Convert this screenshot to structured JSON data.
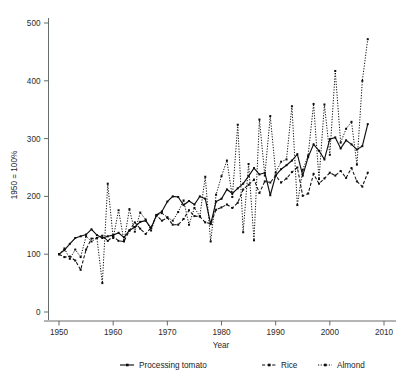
{
  "chart_data": {
    "type": "line",
    "title": "",
    "xlabel": "Year",
    "ylabel": "1950 = 100%",
    "xlim": [
      1948,
      2011
    ],
    "ylim": [
      0,
      520
    ],
    "xticks": [
      1950,
      1960,
      1970,
      1980,
      1990,
      2000,
      2010
    ],
    "xtick_labels": [
      "1950",
      "1960",
      "1970",
      "1980",
      "1990",
      "2000",
      "2010"
    ],
    "yticks": [
      0,
      100,
      200,
      300,
      400,
      500
    ],
    "ytick_labels": [
      "0",
      "100",
      "200",
      "300",
      "400",
      "500"
    ],
    "grid": false,
    "legend_position": "bottom",
    "x": [
      1950,
      1951,
      1952,
      1953,
      1954,
      1955,
      1956,
      1957,
      1958,
      1959,
      1960,
      1961,
      1962,
      1963,
      1964,
      1965,
      1966,
      1967,
      1968,
      1969,
      1970,
      1971,
      1972,
      1973,
      1974,
      1975,
      1976,
      1977,
      1978,
      1979,
      1980,
      1981,
      1982,
      1983,
      1984,
      1985,
      1986,
      1987,
      1988,
      1989,
      1990,
      1991,
      1992,
      1993,
      1994,
      1995,
      1996,
      1997,
      1998,
      1999,
      2000,
      2001,
      2002,
      2003,
      2004,
      2005,
      2006,
      2007
    ],
    "series": [
      {
        "name": "Processing tomato",
        "style": "solid",
        "marker": "square",
        "values": [
          100,
          107,
          118,
          128,
          131,
          134,
          143,
          133,
          128,
          131,
          133,
          137,
          129,
          141,
          147,
          156,
          158,
          145,
          168,
          174,
          191,
          200,
          199,
          185,
          192,
          186,
          200,
          196,
          152,
          191,
          196,
          212,
          205,
          214,
          222,
          235,
          249,
          238,
          241,
          202,
          236,
          247,
          254,
          262,
          273,
          236,
          268,
          290,
          279,
          264,
          299,
          302,
          283,
          297,
          290,
          281,
          287,
          325
        ]
      },
      {
        "name": "Rice",
        "style": "dashed",
        "marker": "square",
        "values": [
          100,
          95,
          96,
          89,
          73,
          108,
          127,
          128,
          132,
          123,
          131,
          123,
          122,
          141,
          155,
          144,
          135,
          146,
          167,
          158,
          163,
          151,
          151,
          161,
          176,
          166,
          165,
          155,
          153,
          177,
          181,
          186,
          180,
          189,
          212,
          220,
          229,
          206,
          226,
          224,
          236,
          224,
          231,
          242,
          250,
          201,
          205,
          239,
          222,
          231,
          241,
          236,
          244,
          232,
          249,
          226,
          217,
          241
        ]
      },
      {
        "name": "Almond",
        "style": "dotted",
        "marker": "square",
        "values": [
          100,
          110,
          92,
          108,
          95,
          131,
          122,
          128,
          50,
          222,
          128,
          176,
          123,
          178,
          139,
          172,
          160,
          141,
          167,
          171,
          164,
          158,
          173,
          193,
          151,
          180,
          166,
          234,
          122,
          203,
          235,
          262,
          199,
          324,
          138,
          256,
          124,
          333,
          236,
          339,
          241,
          260,
          264,
          356,
          185,
          246,
          271,
          360,
          230,
          359,
          272,
          417,
          293,
          317,
          329,
          255,
          400,
          472
        ]
      }
    ]
  },
  "legend": {
    "items": [
      {
        "label": "Processing tomato",
        "style": "solid"
      },
      {
        "label": "Rice",
        "style": "dashed"
      },
      {
        "label": "Almond",
        "style": "dotted"
      }
    ]
  },
  "colors": {
    "ink": "#0d0d0d",
    "axis": "#555a5e",
    "background": "#ffffff"
  }
}
